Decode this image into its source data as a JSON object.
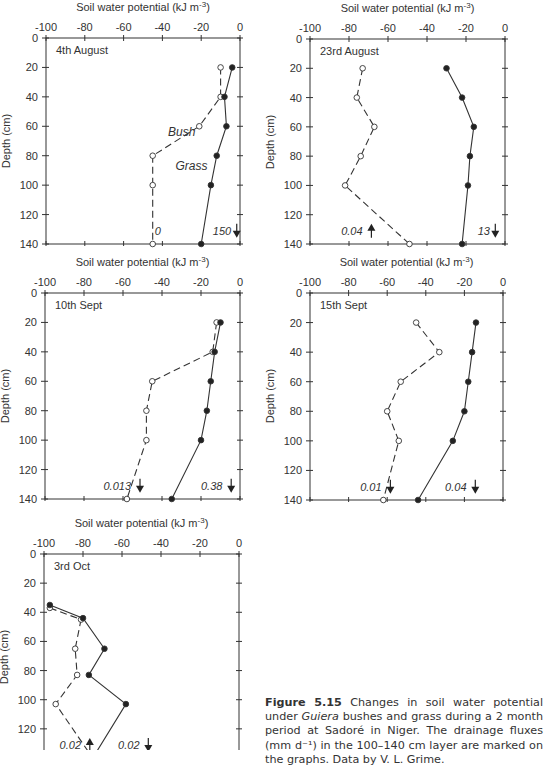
{
  "chart_data": [
    {
      "type": "line",
      "title": "4th August",
      "xlabel": "Soil water potential (kJ m-3)",
      "ylabel": "Depth (cm)",
      "xlim": [
        -100,
        0
      ],
      "ylim": [
        0,
        140
      ],
      "xticks": [
        -100,
        -80,
        -60,
        -40,
        -20,
        0
      ],
      "yticks": [
        0,
        20,
        40,
        60,
        80,
        100,
        120,
        140
      ],
      "series": [
        {
          "name": "Bush",
          "style": "dashed-open-circle",
          "points": [
            [
              -10,
              20
            ],
            [
              -10,
              40
            ],
            [
              -21,
              60
            ],
            [
              -45,
              80
            ],
            [
              -45,
              100
            ],
            [
              -45,
              140
            ]
          ]
        },
        {
          "name": "Grass",
          "style": "solid-filled-circle",
          "points": [
            [
              -4,
              20
            ],
            [
              -8,
              40
            ],
            [
              -7,
              60
            ],
            [
              -12,
              80
            ],
            [
              -15,
              100
            ],
            [
              -20,
              140
            ]
          ]
        }
      ],
      "annotations": [
        {
          "text": "Bush",
          "x": -30,
          "y": 64
        },
        {
          "text": "Grass",
          "x": -25,
          "y": 87
        },
        {
          "text": "0",
          "x": -44,
          "y": 131,
          "arrow": "none"
        },
        {
          "text": "150",
          "x": -14,
          "y": 131,
          "arrow": "down"
        }
      ]
    },
    {
      "type": "line",
      "title": "23rd August",
      "xlabel": "Soil water potential (kJ m-3)",
      "ylabel": "Depth (cm)",
      "xlim": [
        -100,
        0
      ],
      "ylim": [
        0,
        140
      ],
      "xticks": [
        -100,
        -80,
        -60,
        -40,
        -20,
        0
      ],
      "yticks": [
        0,
        20,
        40,
        60,
        80,
        100,
        120,
        140
      ],
      "series": [
        {
          "name": "Bush",
          "style": "dashed-open-circle",
          "points": [
            [
              -73,
              20
            ],
            [
              -76,
              40
            ],
            [
              -67,
              60
            ],
            [
              -74,
              80
            ],
            [
              -82,
              100
            ],
            [
              -49,
              140
            ]
          ]
        },
        {
          "name": "Grass",
          "style": "solid-filled-circle",
          "points": [
            [
              -30,
              20
            ],
            [
              -22,
              40
            ],
            [
              -16,
              60
            ],
            [
              -18,
              80
            ],
            [
              -19,
              100
            ],
            [
              -22,
              140
            ]
          ]
        }
      ],
      "annotations": [
        {
          "text": "0.04",
          "x": -84,
          "y": 131,
          "arrow": "up"
        },
        {
          "text": "13",
          "x": -14,
          "y": 131,
          "arrow": "down"
        }
      ]
    },
    {
      "type": "line",
      "title": "10th Sept",
      "xlabel": "Soil water potential (kJ m-3)",
      "ylabel": "Depth (cm)",
      "xlim": [
        -100,
        0
      ],
      "ylim": [
        0,
        140
      ],
      "xticks": [
        -100,
        -80,
        -60,
        -40,
        -20,
        0
      ],
      "yticks": [
        0,
        20,
        40,
        60,
        80,
        100,
        120,
        140
      ],
      "series": [
        {
          "name": "Bush",
          "style": "dashed-open-circle",
          "points": [
            [
              -12,
              20
            ],
            [
              -14,
              40
            ],
            [
              -45,
              60
            ],
            [
              -48,
              80
            ],
            [
              -48,
              100
            ],
            [
              -58,
              140
            ]
          ]
        },
        {
          "name": "Grass",
          "style": "solid-filled-circle",
          "points": [
            [
              -10,
              20
            ],
            [
              -13,
              40
            ],
            [
              -15,
              60
            ],
            [
              -17,
              80
            ],
            [
              -20,
              100
            ],
            [
              -35,
              140
            ]
          ]
        }
      ],
      "annotations": [
        {
          "text": "0.013",
          "x": -70,
          "y": 131,
          "arrow": "down"
        },
        {
          "text": "0.38",
          "x": -20,
          "y": 131,
          "arrow": "down"
        }
      ]
    },
    {
      "type": "line",
      "title": "15th Sept",
      "xlabel": "Soil water potential (kJ m-3)",
      "ylabel": "Depth (cm)",
      "xlim": [
        -100,
        0
      ],
      "ylim": [
        0,
        140
      ],
      "xticks": [
        -100,
        -80,
        -60,
        -40,
        -20,
        0
      ],
      "yticks": [
        0,
        20,
        40,
        60,
        80,
        100,
        120,
        140
      ],
      "series": [
        {
          "name": "Bush",
          "style": "dashed-open-circle",
          "points": [
            [
              -45,
              20
            ],
            [
              -33,
              40
            ],
            [
              -53,
              60
            ],
            [
              -60,
              80
            ],
            [
              -54,
              100
            ],
            [
              -62,
              140
            ]
          ]
        },
        {
          "name": "Grass",
          "style": "solid-filled-circle",
          "points": [
            [
              -14,
              20
            ],
            [
              -16,
              40
            ],
            [
              -18,
              60
            ],
            [
              -20,
              80
            ],
            [
              -26,
              100
            ],
            [
              -44,
              140
            ]
          ]
        }
      ],
      "annotations": [
        {
          "text": "0.01",
          "x": -74,
          "y": 131,
          "arrow": "down"
        },
        {
          "text": "0.04",
          "x": -30,
          "y": 131,
          "arrow": "down"
        }
      ]
    },
    {
      "type": "line",
      "title": "3rd Oct",
      "xlabel": "Soil water potential (kJ m-3)",
      "ylabel": "Depth (cm)",
      "xlim": [
        -100,
        0
      ],
      "ylim": [
        0,
        140
      ],
      "xticks": [
        -100,
        -80,
        -60,
        -40,
        -20,
        0
      ],
      "yticks": [
        0,
        20,
        40,
        60,
        80,
        100,
        120
      ],
      "series": [
        {
          "name": "Bush",
          "style": "dashed-open-circle",
          "points": [
            [
              -97,
              37
            ],
            [
              -81,
              45
            ],
            [
              -84,
              65
            ],
            [
              -83,
              83
            ],
            [
              -94,
              103
            ],
            [
              -75,
              140
            ]
          ]
        },
        {
          "name": "Grass",
          "style": "solid-filled-circle",
          "points": [
            [
              -97,
              35
            ],
            [
              -80,
              44
            ],
            [
              -69,
              65
            ],
            [
              -77,
              83
            ],
            [
              -58,
              103
            ],
            [
              -75,
              140
            ]
          ]
        }
      ],
      "annotations": [
        {
          "text": "0.02",
          "x": -92,
          "y": 131,
          "arrow": "up"
        },
        {
          "text": "0.02",
          "x": -62,
          "y": 131,
          "arrow": "down"
        }
      ]
    }
  ],
  "panels": [
    {
      "x0": 46,
      "x1": 240,
      "y0": 38,
      "y1": 244
    },
    {
      "x0": 310,
      "x1": 505,
      "y0": 39,
      "y1": 244
    },
    {
      "x0": 45,
      "x1": 240,
      "y0": 293,
      "y1": 499
    },
    {
      "x0": 310,
      "x1": 503,
      "y0": 293,
      "y1": 500
    },
    {
      "x0": 44,
      "x1": 239,
      "y0": 554,
      "y1": 758
    }
  ],
  "caption": {
    "label": "Figure 5.15",
    "text_before_italic": " Changes in soil water potential under ",
    "italic": "Guiera",
    "text_after_italic": " bushes and grass during a 2 month period at Sadoré in Niger. The drainage fluxes (mm d⁻¹) in the 100–140 cm layer are marked on the graphs. Data by V. L. Grime."
  }
}
